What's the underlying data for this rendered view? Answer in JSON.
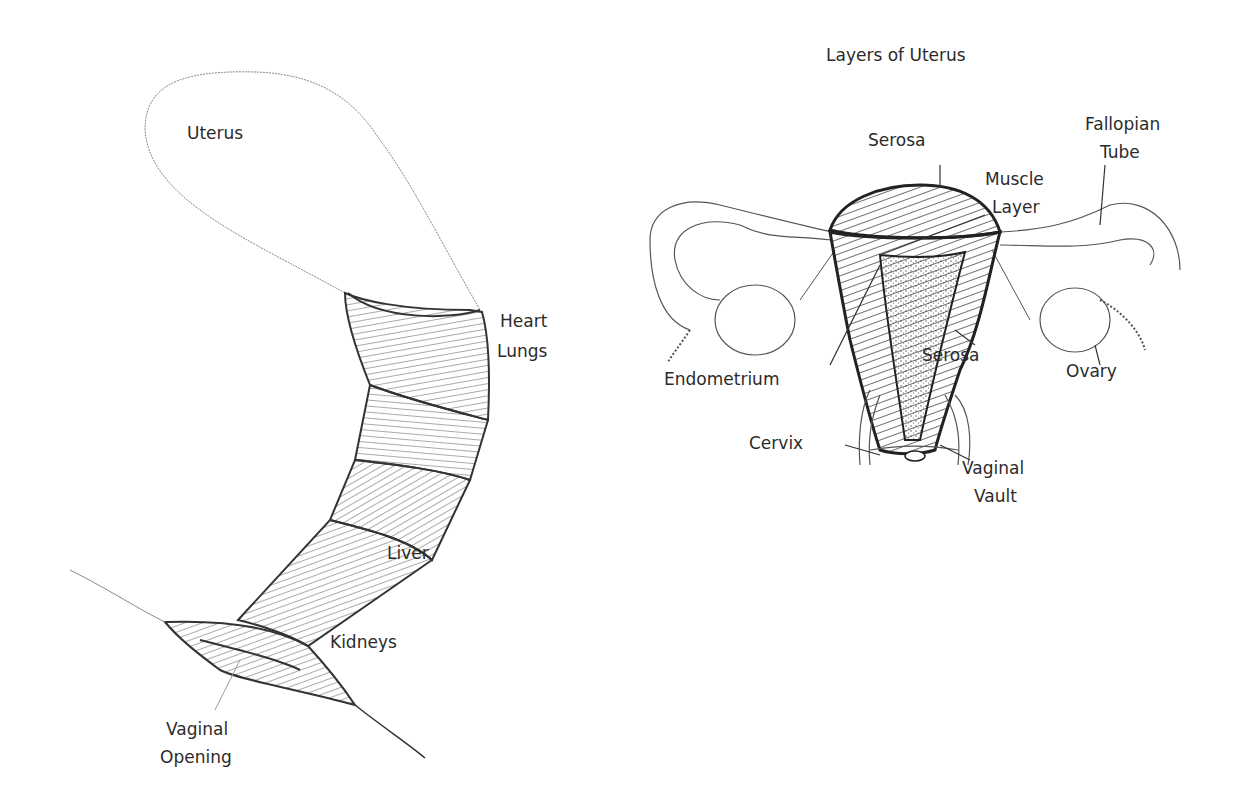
{
  "left_diagram": {
    "labels": {
      "uterus": "Uterus",
      "heart": "Heart",
      "lungs": "Lungs",
      "liver": "Liver",
      "kidneys": "Kidneys",
      "vaginal_opening_1": "Vaginal",
      "vaginal_opening_2": "Opening"
    }
  },
  "right_diagram": {
    "title": "Layers of Uterus",
    "labels": {
      "serosa_top": "Serosa",
      "fallopian_1": "Fallopian",
      "fallopian_2": "Tube",
      "muscle_1": "Muscle",
      "muscle_2": "Layer",
      "endometrium": "Endometrium",
      "serosa_side": "Serosa",
      "ovary": "Ovary",
      "cervix": "Cervix",
      "vault_1": "Vaginal",
      "vault_2": "Vault"
    }
  }
}
